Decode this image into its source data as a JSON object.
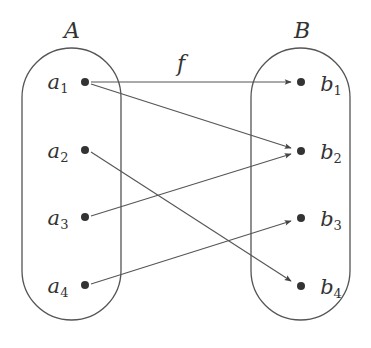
{
  "diagram": {
    "type": "function-mapping",
    "function_label": "f",
    "colors": {
      "stroke": "#555555",
      "dot": "#333333",
      "text": "#333333"
    },
    "sets": [
      {
        "name": "A",
        "elements": [
          {
            "base": "a",
            "sub": "1"
          },
          {
            "base": "a",
            "sub": "2"
          },
          {
            "base": "a",
            "sub": "3"
          },
          {
            "base": "a",
            "sub": "4"
          }
        ]
      },
      {
        "name": "B",
        "elements": [
          {
            "base": "b",
            "sub": "1"
          },
          {
            "base": "b",
            "sub": "2"
          },
          {
            "base": "b",
            "sub": "3"
          },
          {
            "base": "b",
            "sub": "4"
          }
        ]
      }
    ],
    "mappings": [
      {
        "from": "a1",
        "to": "b1"
      },
      {
        "from": "a1",
        "to": "b2"
      },
      {
        "from": "a2",
        "to": "b4"
      },
      {
        "from": "a3",
        "to": "b2"
      },
      {
        "from": "a4",
        "to": "b3"
      }
    ]
  }
}
